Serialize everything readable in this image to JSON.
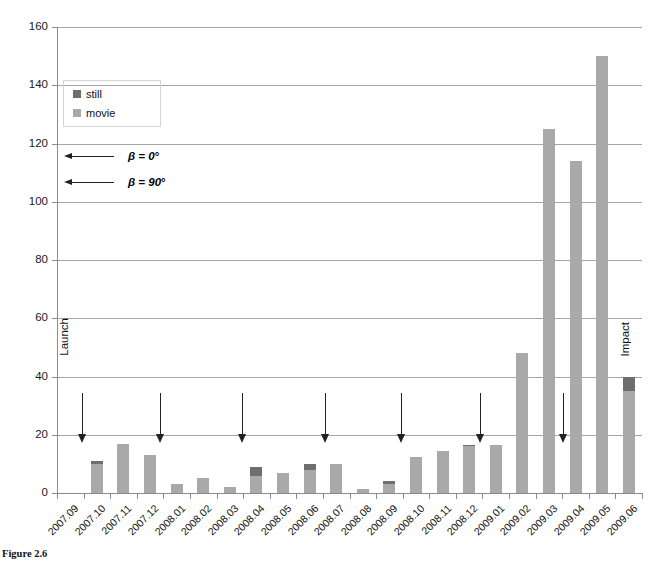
{
  "chart_data": {
    "type": "bar",
    "stacked": true,
    "title": "",
    "xlabel": "",
    "ylabel": "",
    "ylim": [
      0,
      160
    ],
    "ytick_step": 20,
    "yticks": [
      0,
      20,
      40,
      60,
      80,
      100,
      120,
      140,
      160
    ],
    "grid": "horizontal",
    "legend_position": "upper-left-inside",
    "categories": [
      "2007.09",
      "2007.10",
      "2007.11",
      "2007.12",
      "2008.01",
      "2008.02",
      "2008.03",
      "2008.04",
      "2008.05",
      "2008.06",
      "2008.07",
      "2008.08",
      "2008.09",
      "2008.10",
      "2008.11",
      "2008.12",
      "2009.01",
      "2009.02",
      "2009.03",
      "2009.04",
      "2009.05",
      "2009.06"
    ],
    "series": [
      {
        "name": "movie",
        "color": "#a9a9a9",
        "values": [
          0,
          10,
          17,
          13,
          3,
          5,
          2,
          6,
          7,
          8,
          10,
          1.5,
          3,
          12.5,
          14.5,
          16,
          16.5,
          48,
          125,
          114,
          150,
          35
        ]
      },
      {
        "name": "still",
        "color": "#6e6e6e",
        "values": [
          0,
          1,
          0,
          0,
          0,
          0,
          0,
          3,
          0,
          2,
          0,
          0,
          1,
          0,
          0,
          0.5,
          0,
          0,
          0,
          0,
          0,
          5
        ]
      }
    ],
    "totals": [
      0,
      11,
      17,
      13,
      3,
      5,
      2,
      9,
      7,
      10,
      10,
      1.5,
      4,
      12.5,
      14.5,
      16.5,
      16.5,
      48,
      125,
      114,
      150,
      40
    ]
  },
  "legend": {
    "items": [
      {
        "label": "still",
        "color": "#6e6e6e"
      },
      {
        "label": "movie",
        "color": "#a9a9a9"
      }
    ]
  },
  "annotations": {
    "beta": [
      {
        "label": "β = 0",
        "degree": "°"
      },
      {
        "label": "β = 90",
        "degree": "°"
      }
    ],
    "events": [
      {
        "label": "Launch",
        "category": "2007.09"
      },
      {
        "label": "Impact",
        "category": "2009.06"
      }
    ],
    "arrow_marks": [
      {
        "category": "2007.10",
        "x": 82
      },
      {
        "category": "2008.01",
        "x": 160
      },
      {
        "category": "2008.04",
        "x": 242
      },
      {
        "category": "2008.07",
        "x": 325
      },
      {
        "category": "2008.10",
        "x": 401
      },
      {
        "category": "2009.01",
        "x": 480
      },
      {
        "category": "2009.04",
        "x": 563
      }
    ]
  },
  "caption": {
    "figure_number": "Figure 2.6",
    "text": "Hayabusa2 HK camera observation statistics by month"
  },
  "colors": {
    "still": "#6e6e6e",
    "movie": "#a9a9a9",
    "grid": "#a6a6a6",
    "axis": "#8c8c8c",
    "text": "#111111"
  }
}
